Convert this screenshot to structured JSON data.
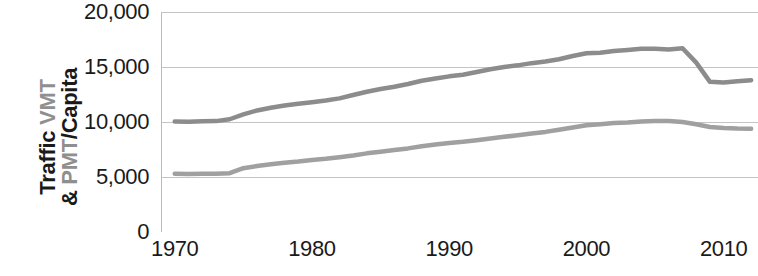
{
  "chart_data": {
    "type": "line",
    "title": "",
    "subtitle": "",
    "xlabel": "",
    "ylabel": "Traffic VMT & PMT/Capita",
    "ylabel_lines": [
      {
        "segments": [
          {
            "text": "Traffic ",
            "style": "dark"
          },
          {
            "text": "VMT",
            "style": "gray"
          }
        ]
      },
      {
        "segments": [
          {
            "text": "& ",
            "style": "dark"
          },
          {
            "text": "PMT",
            "style": "gray"
          },
          {
            "text": "/Capita",
            "style": "dark"
          }
        ]
      }
    ],
    "xlim": [
      1969,
      2012.5
    ],
    "ylim": [
      0,
      20000
    ],
    "grid": true,
    "grid_axis": "y",
    "legend": "none",
    "x_ticks": [
      1970,
      1980,
      1990,
      2000,
      2010
    ],
    "x_tick_labels": [
      "1970",
      "1980",
      "1990",
      "2000",
      "2010"
    ],
    "y_ticks": [
      0,
      5000,
      10000,
      15000,
      20000
    ],
    "y_tick_labels": [
      "0",
      "5,000",
      "10,000",
      "15,000",
      "20,000"
    ],
    "colors": {
      "vmt_line": "#8c8c8c",
      "pmt_line": "#a0a0a0",
      "gridline": "#c4c4c4",
      "axis": "#b9b9b9",
      "text": "#1a1a1a",
      "text_gray": "#8f8f8f"
    },
    "x": [
      1970,
      1971,
      1972,
      1973,
      1974,
      1975,
      1976,
      1977,
      1978,
      1979,
      1980,
      1981,
      1982,
      1983,
      1984,
      1985,
      1986,
      1987,
      1988,
      1989,
      1990,
      1991,
      1992,
      1993,
      1994,
      1995,
      1996,
      1997,
      1998,
      1999,
      2000,
      2001,
      2002,
      2003,
      2004,
      2005,
      2006,
      2007,
      2008,
      2009,
      2010,
      2011,
      2012
    ],
    "series": [
      {
        "name": "VMT",
        "label": "Traffic VMT/Capita",
        "color": "#8c8c8c",
        "values": [
          10050,
          10030,
          10060,
          10080,
          10250,
          10700,
          11050,
          11300,
          11500,
          11650,
          11800,
          11950,
          12150,
          12450,
          12750,
          13000,
          13200,
          13450,
          13750,
          13950,
          14150,
          14300,
          14550,
          14800,
          15000,
          15150,
          15350,
          15500,
          15700,
          16000,
          16250,
          16300,
          16450,
          16550,
          16650,
          16650,
          16600,
          16700,
          15400,
          13650,
          13600,
          13700,
          13800
        ]
      },
      {
        "name": "PMT",
        "label": "PMT/Capita",
        "color": "#a0a0a0",
        "values": [
          5300,
          5280,
          5290,
          5300,
          5350,
          5800,
          6000,
          6150,
          6300,
          6400,
          6550,
          6650,
          6800,
          6950,
          7150,
          7300,
          7450,
          7600,
          7800,
          7950,
          8100,
          8200,
          8350,
          8500,
          8650,
          8800,
          8950,
          9100,
          9300,
          9500,
          9700,
          9800,
          9900,
          9950,
          10050,
          10100,
          10080,
          10000,
          9800,
          9550,
          9450,
          9400,
          9380
        ]
      }
    ]
  }
}
